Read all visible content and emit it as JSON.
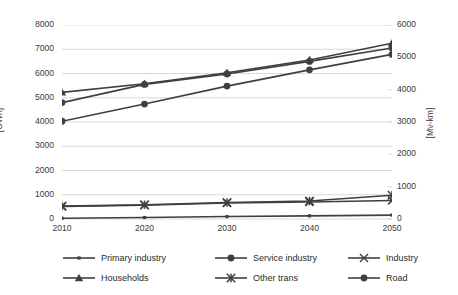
{
  "chart_data": {
    "type": "line",
    "title": "",
    "xlabel": "",
    "ylabel": "[GWh]",
    "y2label": "[Mv-km]",
    "x": [
      2010,
      2020,
      2030,
      2040,
      2050
    ],
    "categories": [
      "2010",
      "2020",
      "2030",
      "2040",
      "2050"
    ],
    "ylim": [
      0,
      8000
    ],
    "y2lim": [
      0,
      6000
    ],
    "yticks": [
      0,
      1000,
      2000,
      3000,
      4000,
      5000,
      6000,
      7000,
      8000
    ],
    "y2ticks": [
      0,
      1000,
      2000,
      3000,
      4000,
      5000,
      6000
    ],
    "ytick_labels": [
      "0",
      "1000",
      "2000",
      "3000",
      "4000",
      "5000",
      "6000",
      "7000",
      "8000"
    ],
    "y2tick_labels": [
      "0",
      "1000",
      "2000",
      "3000",
      "4000",
      "5000",
      "6000"
    ],
    "grid": true,
    "grid_axis": "y",
    "legend_position": "bottom",
    "line_color": "#3f3f3f",
    "grid_color": "#d9d9d9",
    "series": [
      {
        "name": "Primary industry",
        "axis": "left",
        "marker": "small-square",
        "values": [
          30,
          60,
          100,
          130,
          160
        ]
      },
      {
        "name": "Service industry",
        "axis": "left",
        "marker": "circle",
        "values": [
          4800,
          5550,
          5980,
          6500,
          7050
        ]
      },
      {
        "name": "Industry",
        "axis": "left",
        "marker": "x-cross",
        "values": [
          520,
          570,
          660,
          700,
          760
        ]
      },
      {
        "name": "Households",
        "axis": "left",
        "marker": "triangle",
        "values": [
          5220,
          5580,
          6030,
          6560,
          7250
        ]
      },
      {
        "name": "Other trans",
        "axis": "left",
        "marker": "asterisk",
        "values": [
          530,
          590,
          680,
          740,
          980
        ]
      },
      {
        "name": "Road",
        "axis": "left",
        "marker": "circle",
        "values": [
          4030,
          4740,
          5480,
          6150,
          6790
        ]
      }
    ]
  },
  "legend": {
    "entries": [
      {
        "label": "Primary industry",
        "marker": "small-square"
      },
      {
        "label": "Service industry",
        "marker": "circle"
      },
      {
        "label": "Industry",
        "marker": "x-cross"
      },
      {
        "label": "Households",
        "marker": "triangle"
      },
      {
        "label": "Other trans",
        "marker": "asterisk"
      },
      {
        "label": "Road",
        "marker": "circle"
      }
    ]
  }
}
